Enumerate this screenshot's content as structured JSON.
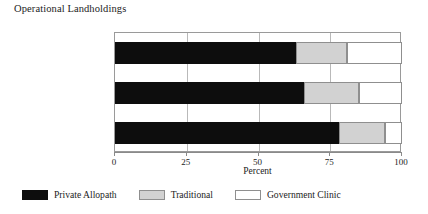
{
  "chart_data": {
    "type": "bar",
    "subtype": "horizontal-stacked-100",
    "title": "Operational Landholdings",
    "xlabel": "Percent",
    "ylabel": "",
    "xlim": [
      0,
      100
    ],
    "xticks": [
      0,
      25,
      50,
      75,
      100
    ],
    "xtick_labels": [
      "0",
      "25",
      "50",
      "75",
      "100"
    ],
    "grid": true,
    "legend_position": "bottom",
    "categories": [
      "Less than 0.50 Acres",
      "0.51 to 2.5 Acres",
      "More than 2.5 Acres"
    ],
    "series": [
      {
        "name": "Private Allopath",
        "color": "#0d0d0d",
        "values": [
          63,
          66,
          78
        ]
      },
      {
        "name": "Traditional",
        "color": "#d2d2d2",
        "values": [
          18,
          19,
          16
        ]
      },
      {
        "name": "Government Clinic",
        "color": "#ffffff",
        "values": [
          19,
          15,
          6
        ]
      }
    ]
  }
}
